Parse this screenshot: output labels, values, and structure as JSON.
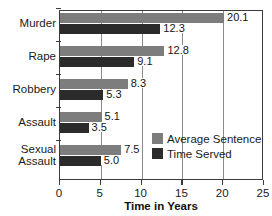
{
  "chart_data": {
    "type": "bar",
    "orientation": "horizontal",
    "title": "",
    "xlabel": "Time in Years",
    "ylabel": "",
    "xlim": [
      0,
      25
    ],
    "xticks": [
      0,
      5,
      10,
      15,
      20,
      25
    ],
    "xtick_labels": [
      "0",
      "5",
      "10",
      "15",
      "20",
      "25"
    ],
    "grid": true,
    "grid_axis": "x",
    "legend_position": "inside-lower-right",
    "categories": [
      "Murder",
      "Rape",
      "Robbery",
      "Assault",
      "Sexual Assault"
    ],
    "category_label_lines": [
      [
        "Murder"
      ],
      [
        "Rape"
      ],
      [
        "Robbery"
      ],
      [
        "Assault"
      ],
      [
        "Sexual",
        "Assault"
      ]
    ],
    "series": [
      {
        "name": "Average Sentence",
        "color": "#7d7d7d",
        "values": [
          20.1,
          12.8,
          8.3,
          5.1,
          7.5
        ],
        "labels": [
          "20.1",
          "12.8",
          "8.3",
          "5.1",
          "7.5"
        ]
      },
      {
        "name": "Time Served",
        "color": "#2b2b2b",
        "values": [
          12.3,
          9.1,
          5.3,
          3.5,
          5.0
        ],
        "labels": [
          "12.3",
          "9.1",
          "5.3",
          "3.5",
          "5.0"
        ]
      }
    ]
  },
  "colors": {
    "average_sentence": "#7d7d7d",
    "time_served": "#2b2b2b",
    "axis": "#3b3b3b",
    "gridline": "#8c8c8c",
    "text": "#1a1a1a",
    "background": "#ffffff"
  }
}
